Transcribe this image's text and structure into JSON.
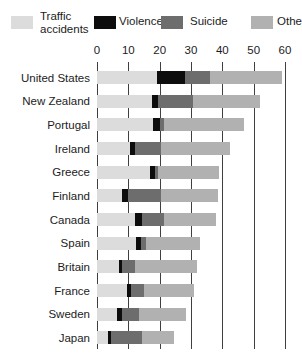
{
  "colors": {
    "background": "#ffffff",
    "gridline": "#3f3f3f",
    "text": "#1c1c1c"
  },
  "chart_data": {
    "type": "bar",
    "orientation": "horizontal",
    "stacked": true,
    "title": "",
    "xlabel": "",
    "ylabel": "",
    "xlim": [
      0,
      60
    ],
    "xticks": [
      "0",
      "10",
      "20",
      "30",
      "40",
      "50",
      "60"
    ],
    "grid": "vertical",
    "legend_position": "top",
    "categories": [
      "United States",
      "New Zealand",
      "Portugal",
      "Ireland",
      "Greece",
      "Finland",
      "Canada",
      "Spain",
      "Britain",
      "France",
      "Sweden",
      "Japan"
    ],
    "series": [
      {
        "name": "Traffic accidents",
        "color": "#dcdcdc",
        "values": [
          19,
          17.5,
          18,
          10.5,
          17,
          8,
          12,
          12.5,
          7,
          9.5,
          6.5,
          3.5
        ]
      },
      {
        "name": "Violence",
        "color": "#0d0d0d",
        "values": [
          9,
          2,
          2,
          1.5,
          1.5,
          2,
          2.5,
          1.5,
          1,
          1.5,
          1.5,
          1
        ]
      },
      {
        "name": "Suicide",
        "color": "#6d6d6d",
        "values": [
          8,
          11,
          1.5,
          8.5,
          1,
          10.5,
          7,
          1.5,
          4,
          4,
          5.5,
          10
        ]
      },
      {
        "name": "Other",
        "color": "#b1b1b1",
        "values": [
          23,
          21.5,
          25.5,
          22,
          19.5,
          18,
          16.5,
          17.5,
          20,
          16,
          15,
          10
        ]
      }
    ],
    "totals": [
      59,
      52,
      47,
      42.5,
      39,
      38.5,
      38,
      33,
      32,
      31,
      28.5,
      24.5
    ]
  }
}
